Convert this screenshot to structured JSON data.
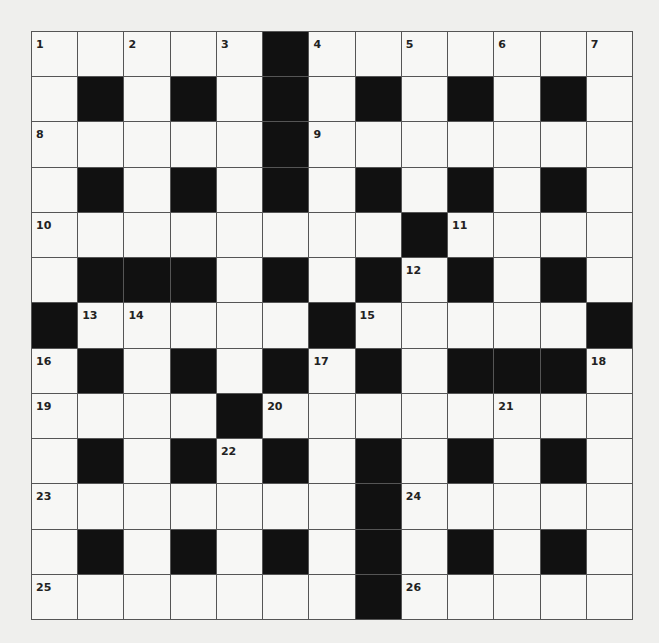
{
  "puzzle": {
    "rows": 13,
    "cols": 13,
    "colors": {
      "black": "#111111",
      "white": "#f7f7f5",
      "line": "#555555"
    },
    "grid": [
      "1.2.3#4.5.6.7",
      ".#.#.#.#.#.#.",
      "8....#9......",
      ".#.#.#.#.#.#.",
      "A.......#B...",
      ".###.#.#C#.#.",
      "#DE...#F....#",
      "G#.#.#H#.###I",
      "J...#K....L..",
      ".#.#M#.#.#.#.",
      "N......#O....",
      ".#.#.#.#.#.#.",
      "P......#Q...."
    ],
    "numbers": [
      {
        "r": 0,
        "c": 0,
        "n": "1"
      },
      {
        "r": 0,
        "c": 2,
        "n": "2"
      },
      {
        "r": 0,
        "c": 4,
        "n": "3"
      },
      {
        "r": 0,
        "c": 6,
        "n": "4"
      },
      {
        "r": 0,
        "c": 8,
        "n": "5"
      },
      {
        "r": 0,
        "c": 10,
        "n": "6"
      },
      {
        "r": 0,
        "c": 12,
        "n": "7"
      },
      {
        "r": 2,
        "c": 0,
        "n": "8"
      },
      {
        "r": 2,
        "c": 6,
        "n": "9"
      },
      {
        "r": 4,
        "c": 0,
        "n": "10"
      },
      {
        "r": 4,
        "c": 9,
        "n": "11"
      },
      {
        "r": 5,
        "c": 8,
        "n": "12"
      },
      {
        "r": 6,
        "c": 1,
        "n": "13"
      },
      {
        "r": 6,
        "c": 2,
        "n": "14"
      },
      {
        "r": 6,
        "c": 7,
        "n": "15"
      },
      {
        "r": 7,
        "c": 0,
        "n": "16"
      },
      {
        "r": 7,
        "c": 6,
        "n": "17"
      },
      {
        "r": 7,
        "c": 12,
        "n": "18"
      },
      {
        "r": 8,
        "c": 0,
        "n": "19"
      },
      {
        "r": 8,
        "c": 5,
        "n": "20"
      },
      {
        "r": 8,
        "c": 10,
        "n": "21"
      },
      {
        "r": 9,
        "c": 4,
        "n": "22"
      },
      {
        "r": 10,
        "c": 0,
        "n": "23"
      },
      {
        "r": 10,
        "c": 8,
        "n": "24"
      },
      {
        "r": 12,
        "c": 0,
        "n": "25"
      },
      {
        "r": 12,
        "c": 8,
        "n": "26"
      }
    ]
  }
}
